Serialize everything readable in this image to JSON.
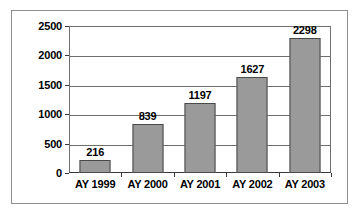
{
  "chart_data": {
    "type": "bar",
    "title": "",
    "subtitle": "",
    "xlabel": "",
    "ylabel": "",
    "categories": [
      "AY 1999",
      "AY 2000",
      "AY 2001",
      "AY 2002",
      "AY 2003"
    ],
    "values": [
      216,
      839,
      1197,
      1627,
      2298
    ],
    "data_labels": [
      "216",
      "839",
      "1197",
      "1627",
      "2298"
    ],
    "ylim": [
      0,
      2500
    ],
    "y_ticks": [
      0,
      500,
      1000,
      1500,
      2000,
      2500
    ],
    "y_tick_labels": [
      "0",
      "500",
      "1000",
      "1500",
      "2000",
      "2500"
    ],
    "grid": "horizontal",
    "legend": "none",
    "colors": {
      "bar_fill": "#9a9a9a",
      "bar_border": "#4a4a4a",
      "gridline": "#6f6f6f",
      "axis": "#3a3a3a",
      "frame_border": "#8e8e8e",
      "text": "#000000",
      "background": "#ffffff"
    }
  }
}
